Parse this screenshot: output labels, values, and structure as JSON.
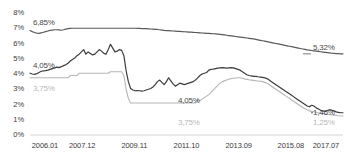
{
  "chart_data": {
    "type": "line",
    "title": "",
    "xlabel": "",
    "ylabel": "",
    "grid": false,
    "legend": "none",
    "ylim": [
      0,
      8
    ],
    "yticks": [
      "0%",
      "1%",
      "2%",
      "3%",
      "4%",
      "5%",
      "6%",
      "7%",
      "8%"
    ],
    "ytick_values": [
      0,
      1,
      2,
      3,
      4,
      5,
      6,
      7,
      8
    ],
    "xticks": [
      "2006.01",
      "2007.12",
      "2009.11",
      "2011.10",
      "2013.09",
      "2015.08",
      "2017.07"
    ],
    "x_start": "2006.01",
    "x_end": "2017.07",
    "n_points": 139,
    "series": [
      {
        "name": "upper-line",
        "color": "#5a5a5a",
        "start_value": 6.85,
        "end_value": 5.32,
        "values": [
          6.85,
          6.78,
          6.72,
          6.68,
          6.66,
          6.7,
          6.74,
          6.78,
          6.82,
          6.86,
          6.88,
          6.9,
          6.9,
          6.89,
          6.87,
          6.9,
          6.94,
          6.97,
          6.99,
          7.0,
          7.0,
          7.0,
          7.0,
          7.0,
          7.0,
          7.0,
          7.0,
          7.0,
          7.0,
          7.0,
          7.0,
          7.0,
          7.0,
          7.0,
          7.0,
          7.0,
          7.0,
          7.0,
          7.0,
          7.0,
          7.0,
          7.0,
          7.0,
          7.0,
          7.0,
          7.0,
          7.0,
          7.0,
          6.99,
          6.99,
          6.98,
          6.98,
          6.97,
          6.96,
          6.95,
          6.94,
          6.93,
          6.92,
          6.9,
          6.88,
          6.86,
          6.85,
          6.84,
          6.83,
          6.82,
          6.81,
          6.8,
          6.79,
          6.78,
          6.77,
          6.76,
          6.75,
          6.74,
          6.73,
          6.72,
          6.71,
          6.7,
          6.69,
          6.68,
          6.67,
          6.66,
          6.65,
          6.64,
          6.63,
          6.62,
          6.6,
          6.58,
          6.56,
          6.54,
          6.52,
          6.5,
          6.48,
          6.46,
          6.44,
          6.42,
          6.4,
          6.38,
          6.36,
          6.34,
          6.32,
          6.3,
          6.27,
          6.24,
          6.21,
          6.18,
          6.15,
          6.12,
          6.09,
          6.06,
          6.03,
          6.0,
          5.97,
          5.94,
          5.91,
          5.88,
          5.85,
          5.82,
          5.79,
          5.76,
          5.73,
          5.7,
          5.67,
          5.64,
          5.61,
          5.58,
          5.56,
          5.54,
          5.52,
          5.5,
          5.48,
          5.46,
          5.44,
          5.42,
          5.4,
          5.38,
          5.36,
          5.35,
          5.34,
          5.33,
          5.32,
          5.32
        ]
      },
      {
        "name": "middle-line",
        "color": "#3c3c3c",
        "start_value": 4.05,
        "end_value": 1.46,
        "values": [
          4.05,
          4.0,
          3.98,
          4.02,
          4.1,
          4.18,
          4.2,
          4.22,
          4.25,
          4.3,
          4.35,
          4.4,
          4.45,
          4.42,
          4.48,
          4.55,
          4.6,
          4.7,
          4.85,
          4.95,
          5.05,
          5.2,
          5.3,
          5.45,
          5.6,
          5.3,
          5.45,
          5.35,
          5.25,
          5.3,
          5.45,
          5.6,
          5.5,
          5.35,
          5.3,
          5.6,
          5.95,
          5.7,
          5.45,
          5.5,
          5.6,
          5.55,
          5.2,
          4.2,
          3.5,
          3.05,
          2.95,
          2.9,
          2.92,
          2.9,
          2.88,
          2.9,
          2.95,
          3.0,
          3.05,
          3.15,
          3.3,
          3.5,
          3.6,
          3.45,
          3.3,
          3.5,
          3.75,
          3.55,
          3.35,
          3.2,
          3.3,
          3.4,
          3.35,
          3.3,
          3.35,
          3.4,
          3.45,
          3.5,
          3.6,
          3.75,
          3.9,
          4.0,
          4.05,
          4.1,
          4.25,
          4.3,
          4.32,
          4.35,
          4.38,
          4.4,
          4.42,
          4.4,
          4.38,
          4.4,
          4.42,
          4.4,
          4.35,
          4.3,
          4.25,
          4.15,
          4.05,
          3.95,
          3.9,
          3.88,
          3.85,
          3.85,
          3.82,
          3.8,
          3.78,
          3.75,
          3.7,
          3.6,
          3.5,
          3.4,
          3.3,
          3.2,
          3.1,
          3.0,
          2.9,
          2.8,
          2.7,
          2.6,
          2.5,
          2.4,
          2.3,
          2.2,
          2.1,
          2.0,
          1.9,
          1.85,
          1.95,
          1.9,
          1.78,
          1.7,
          1.62,
          1.58,
          1.55,
          1.6,
          1.66,
          1.62,
          1.58,
          1.52,
          1.48,
          1.46,
          1.46
        ]
      },
      {
        "name": "lower-line",
        "color": "#b5b5b5",
        "start_value": 3.75,
        "end_value": 1.25,
        "values": [
          3.75,
          3.75,
          3.75,
          3.75,
          3.75,
          3.75,
          3.75,
          3.75,
          3.75,
          3.75,
          3.75,
          3.75,
          3.75,
          3.75,
          3.75,
          3.75,
          3.75,
          3.75,
          3.9,
          3.9,
          3.9,
          3.9,
          4.05,
          4.05,
          4.05,
          4.05,
          4.05,
          4.05,
          4.05,
          4.05,
          4.05,
          4.05,
          4.05,
          4.05,
          4.05,
          4.05,
          4.15,
          4.15,
          4.15,
          4.15,
          4.15,
          4.15,
          3.9,
          3.0,
          2.4,
          2.1,
          2.1,
          2.1,
          2.1,
          2.1,
          2.1,
          2.1,
          2.1,
          2.1,
          2.1,
          2.1,
          2.1,
          2.1,
          2.1,
          2.1,
          2.1,
          2.1,
          2.1,
          2.1,
          2.1,
          2.1,
          2.1,
          2.1,
          2.1,
          2.1,
          2.1,
          2.1,
          2.1,
          2.1,
          2.1,
          2.25,
          2.25,
          2.35,
          2.45,
          2.55,
          2.65,
          2.8,
          2.95,
          3.1,
          3.25,
          3.4,
          3.5,
          3.55,
          3.6,
          3.65,
          3.7,
          3.72,
          3.74,
          3.75,
          3.75,
          3.72,
          3.68,
          3.65,
          3.62,
          3.6,
          3.58,
          3.56,
          3.54,
          3.52,
          3.5,
          3.45,
          3.4,
          3.3,
          3.2,
          3.1,
          3.0,
          2.9,
          2.8,
          2.7,
          2.6,
          2.5,
          2.4,
          2.3,
          2.2,
          2.1,
          2.0,
          1.9,
          1.8,
          1.72,
          1.65,
          1.58,
          1.55,
          1.52,
          1.48,
          1.45,
          1.42,
          1.4,
          1.38,
          1.36,
          1.34,
          1.32,
          1.3,
          1.28,
          1.26,
          1.25,
          1.25
        ]
      }
    ],
    "annotations": [
      {
        "name": "upper-start-label",
        "text": "6,85%",
        "style": "dark",
        "x": 33,
        "y": 18
      },
      {
        "name": "upper-end-label",
        "text": "5,32%",
        "style": "dark",
        "x": 313,
        "y": 43
      },
      {
        "name": "middle-start-label",
        "text": "4,05%",
        "style": "dark",
        "x": 33,
        "y": 61
      },
      {
        "name": "middle-mid-label",
        "text": "4,05%",
        "style": "dark",
        "x": 178,
        "y": 96
      },
      {
        "name": "middle-end-label",
        "text": "1,46%",
        "style": "dark",
        "x": 313,
        "y": 108
      },
      {
        "name": "lower-start-label",
        "text": "3,75%",
        "style": "light",
        "x": 33,
        "y": 84
      },
      {
        "name": "lower-mid-label",
        "text": "3,75%",
        "style": "light",
        "x": 178,
        "y": 118
      },
      {
        "name": "lower-end-label",
        "text": "1,25%",
        "style": "light",
        "x": 313,
        "y": 118
      }
    ]
  }
}
